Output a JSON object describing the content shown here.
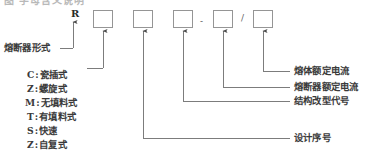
{
  "figure": {
    "kind": "model-designation-breakdown",
    "partial_top_caption": "图 字母含义说明",
    "prefix_code": "R",
    "separators": {
      "dash": "-",
      "slash": "/"
    },
    "boxes": [
      {
        "id": "box-1",
        "value": ""
      },
      {
        "id": "box-2",
        "value": ""
      },
      {
        "id": "box-3",
        "value": ""
      },
      {
        "id": "box-4",
        "value": ""
      },
      {
        "id": "box-5",
        "value": ""
      }
    ],
    "left_labels": {
      "type_label": "熔断器形式"
    },
    "legend": {
      "items": [
        {
          "code": "C",
          "sep": ":",
          "name": "瓷插式"
        },
        {
          "code": "Z",
          "sep": ":",
          "name": "螺旋式"
        },
        {
          "code": "M",
          "sep": ":",
          "name": "无填料式"
        },
        {
          "code": "T",
          "sep": ":",
          "name": "有填料式"
        },
        {
          "code": "S",
          "sep": ":",
          "name": "快速"
        },
        {
          "code": "Z",
          "sep": ":",
          "name": "自复式"
        }
      ]
    },
    "right_labels": [
      {
        "id": "melt-rated-current",
        "text": "熔体额定电流"
      },
      {
        "id": "fuse-rated-current",
        "text": "熔断器额定电流"
      },
      {
        "id": "structure-variant-code",
        "text": "结构改型代号"
      },
      {
        "id": "design-serial-number",
        "text": "设计序号"
      }
    ],
    "colors": {
      "ink": "#3a3a3a",
      "line": "#6e6e6e",
      "box_stroke": "#8a8a8a",
      "background": "#ffffff"
    }
  }
}
